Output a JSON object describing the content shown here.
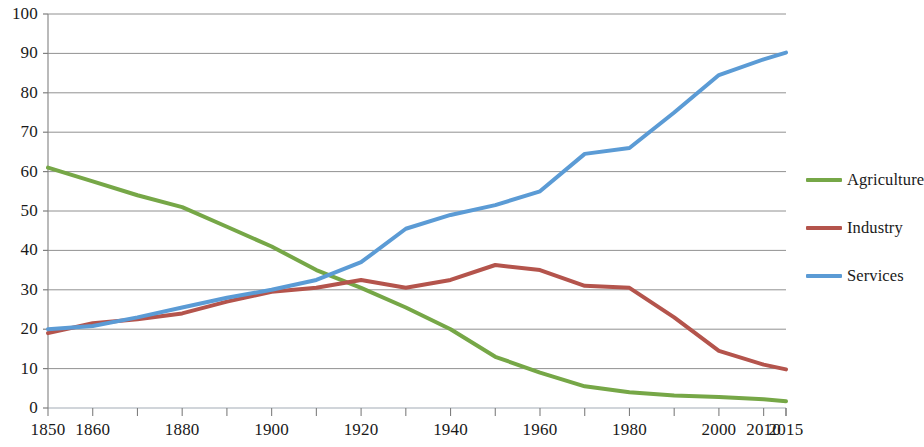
{
  "chart_data": {
    "type": "line",
    "title": "",
    "subtitle": "",
    "xlabel": "",
    "ylabel": "",
    "xlim": [
      1850,
      2015
    ],
    "ylim": [
      0,
      100
    ],
    "grid": true,
    "legend_position": "right",
    "y_ticks": [
      0,
      10,
      20,
      30,
      40,
      50,
      60,
      70,
      80,
      90,
      100
    ],
    "y_tick_labels": [
      "0",
      "10",
      "20",
      "30",
      "40",
      "50",
      "60",
      "70",
      "80",
      "90",
      "100"
    ],
    "x_ticks": [
      1850,
      1860,
      1880,
      1900,
      1920,
      1940,
      1960,
      1980,
      2000,
      2010,
      2015
    ],
    "x_tick_labels": [
      "1850",
      "1860",
      "1880",
      "1900",
      "1920",
      "1940",
      "1960",
      "1980",
      "2000",
      "2010",
      "2015"
    ],
    "x_minor_ticks": [
      1870,
      1890,
      1910,
      1930,
      1950,
      1970,
      1990
    ],
    "x": [
      1850,
      1860,
      1870,
      1880,
      1890,
      1900,
      1910,
      1920,
      1930,
      1940,
      1950,
      1960,
      1970,
      1980,
      1990,
      2000,
      2010,
      2015
    ],
    "series": [
      {
        "name": "Agriculture",
        "color": "#76A747",
        "values": [
          61,
          57.5,
          54,
          51,
          46,
          41,
          35,
          30.5,
          25.5,
          20,
          13,
          9,
          5.5,
          4,
          3.2,
          2.8,
          2.2,
          1.7
        ]
      },
      {
        "name": "Industry",
        "color": "#B4544C",
        "values": [
          19,
          21.5,
          22.5,
          24,
          27,
          29.5,
          30.5,
          32.5,
          30.5,
          32.5,
          36.3,
          35,
          31,
          30.5,
          23,
          14.5,
          11,
          9.8
        ]
      },
      {
        "name": "Services",
        "color": "#5B9BD5",
        "values": [
          20,
          20.8,
          23,
          25.5,
          28,
          30,
          32.5,
          37,
          45.5,
          49,
          51.5,
          55,
          64.5,
          66,
          75,
          84.5,
          88.5,
          90.2
        ]
      }
    ]
  },
  "legend": {
    "items": [
      {
        "label": "Agriculture",
        "color": "#76A747"
      },
      {
        "label": "Industry",
        "color": "#B4544C"
      },
      {
        "label": "Services",
        "color": "#5B9BD5"
      }
    ]
  },
  "axes": {
    "axis_color": "#8c8c8c",
    "gridline_color": "#7f7f7f",
    "tick_color": "#7f7f7f"
  }
}
